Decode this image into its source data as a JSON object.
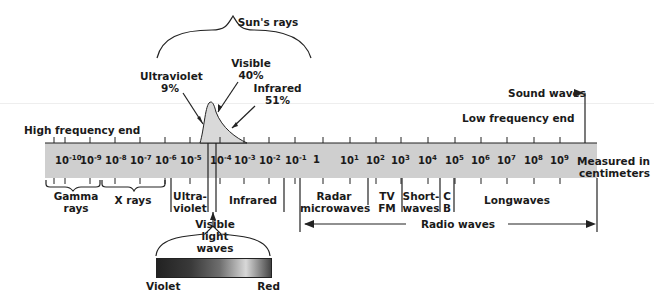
{
  "sun_rays": {
    "label": "Sun's rays",
    "components": [
      {
        "name": "Ultraviolet",
        "percent": "9%"
      },
      {
        "name": "Visible",
        "percent": "40%"
      },
      {
        "name": "Infrared",
        "percent": "51%"
      }
    ]
  },
  "scale": {
    "high_end_label": "High frequency end",
    "low_end_label": "Low frequency end",
    "sound_waves_label": "Sound waves",
    "units_label_line1": "Measured in",
    "units_label_line2": "centimeters",
    "ticks": [
      {
        "base": "10",
        "exp": "-10"
      },
      {
        "base": "10",
        "exp": "-9"
      },
      {
        "base": "10",
        "exp": "-8"
      },
      {
        "base": "10",
        "exp": "-7"
      },
      {
        "base": "10",
        "exp": "-6"
      },
      {
        "base": "10",
        "exp": "-5"
      },
      {
        "base": "10",
        "exp": "-4"
      },
      {
        "base": "10",
        "exp": "-3"
      },
      {
        "base": "10",
        "exp": "-2"
      },
      {
        "base": "10",
        "exp": "-1"
      },
      {
        "base": "1",
        "exp": ""
      },
      {
        "base": "10",
        "exp": "1"
      },
      {
        "base": "10",
        "exp": "2"
      },
      {
        "base": "10",
        "exp": "3"
      },
      {
        "base": "10",
        "exp": "4"
      },
      {
        "base": "10",
        "exp": "5"
      },
      {
        "base": "10",
        "exp": "6"
      },
      {
        "base": "10",
        "exp": "7"
      },
      {
        "base": "10",
        "exp": "8"
      },
      {
        "base": "10",
        "exp": "9"
      }
    ]
  },
  "bands": {
    "gamma_line1": "Gamma",
    "gamma_line2": "rays",
    "xrays": "X rays",
    "uv_line1": "Ultra-",
    "uv_line2": "violet",
    "infrared": "Infrared",
    "radar_line1": "Radar",
    "radar_line2": "microwaves",
    "tv_line1": "TV",
    "tv_line2": "FM",
    "short_line1": "Short-",
    "short_line2": "waves",
    "cb_line1": "C",
    "cb_line2": "B",
    "longwaves": "Longwaves",
    "radio_waves": "Radio waves"
  },
  "visible": {
    "label_line1": "Visible",
    "label_line2": "light",
    "label_line3": "waves",
    "left_label": "Violet",
    "right_label": "Red"
  }
}
